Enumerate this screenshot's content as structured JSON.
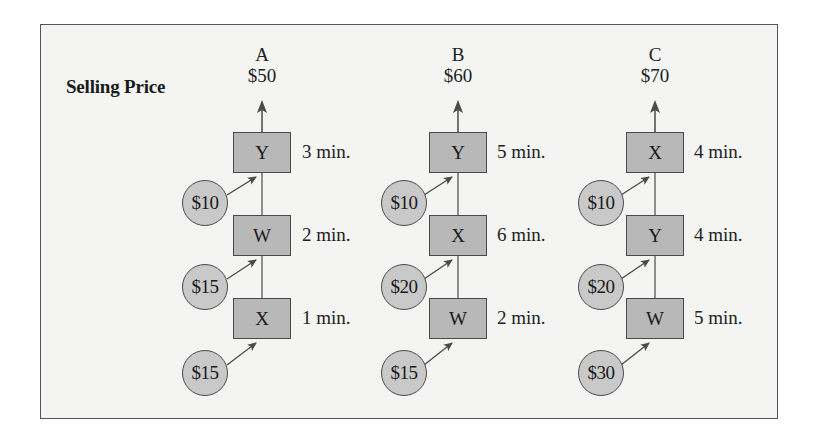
{
  "title": "Selling Price",
  "colors": {
    "background": "#f4f4f3",
    "box_fill": "#b8b8b8",
    "circle_fill": "#c9c9c9",
    "stroke": "#4a4a4a"
  },
  "products": [
    {
      "name": "A",
      "price": "$50",
      "steps": [
        {
          "machine": "Y",
          "time": "3 min.",
          "material_cost": "$10"
        },
        {
          "machine": "W",
          "time": "2 min.",
          "material_cost": "$15"
        },
        {
          "machine": "X",
          "time": "1 min.",
          "material_cost": "$15"
        }
      ]
    },
    {
      "name": "B",
      "price": "$60",
      "steps": [
        {
          "machine": "Y",
          "time": "5 min.",
          "material_cost": "$10"
        },
        {
          "machine": "X",
          "time": "6 min.",
          "material_cost": "$20"
        },
        {
          "machine": "W",
          "time": "2 min.",
          "material_cost": "$15"
        }
      ]
    },
    {
      "name": "C",
      "price": "$70",
      "steps": [
        {
          "machine": "X",
          "time": "4 min.",
          "material_cost": "$10"
        },
        {
          "machine": "Y",
          "time": "4 min.",
          "material_cost": "$20"
        },
        {
          "machine": "W",
          "time": "5 min.",
          "material_cost": "$30"
        }
      ]
    }
  ]
}
